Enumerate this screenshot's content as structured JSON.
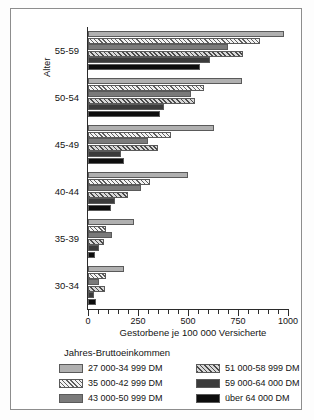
{
  "chart_data": {
    "type": "bar",
    "orientation": "horizontal",
    "title": "",
    "xlabel": "Gestorbene je 100 000 Versicherte",
    "ylabel": "Alter",
    "xlim": [
      0,
      1000
    ],
    "xticks": [
      0,
      250,
      500,
      750,
      1000
    ],
    "xticklabels": [
      "0",
      "250",
      "500",
      "750",
      "1000"
    ],
    "minor_tick_step": 50,
    "grid": false,
    "legend_title": "Jahres-Bruttoeinkommen",
    "legend_position": "bottom",
    "categories": [
      "55-59",
      "50-54",
      "45-49",
      "40-44",
      "35-39",
      "30-34"
    ],
    "series": [
      {
        "name": "27 000-34 999 DM",
        "pattern": "solid-light-gray",
        "color": "#b0b0b0",
        "values": [
          980,
          770,
          630,
          500,
          230,
          180
        ]
      },
      {
        "name": "35 000-42 999 DM",
        "pattern": "diagonal-hatch-light",
        "color": "#f2f2f2",
        "values": [
          860,
          580,
          415,
          310,
          90,
          90
        ]
      },
      {
        "name": "43 000-50 999 DM",
        "pattern": "solid-medium-gray",
        "color": "#7a7a7a",
        "values": [
          700,
          515,
          300,
          265,
          120,
          55
        ]
      },
      {
        "name": "51 000-58 999 DM",
        "pattern": "diagonal-hatch-dense",
        "color": "#d8d8d8",
        "values": [
          775,
          535,
          350,
          200,
          80,
          85
        ]
      },
      {
        "name": "59 000-64 000 DM",
        "pattern": "solid-dark-gray",
        "color": "#3b3b3b",
        "values": [
          610,
          380,
          165,
          135,
          55,
          30
        ]
      },
      {
        "name": "über 64 000 DM",
        "pattern": "solid-black",
        "color": "#0d0d0d",
        "values": [
          560,
          360,
          180,
          115,
          35,
          40
        ]
      }
    ]
  },
  "legend": {
    "title": "Jahres-Bruttoeinkommen",
    "left_column": [
      "27 000-34 999 DM",
      "35 000-42 999 DM",
      "43 000-50 999 DM"
    ],
    "right_column": [
      "51 000-58 999 DM",
      "59 000-64 000 DM",
      "über 64 000 DM"
    ]
  }
}
